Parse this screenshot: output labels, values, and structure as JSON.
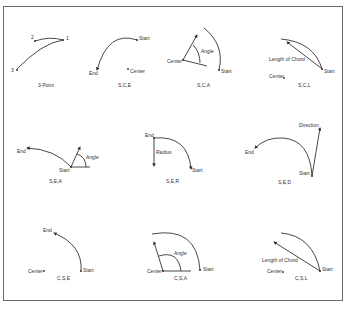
{
  "panels": [
    {
      "id": "3p",
      "caption": "3-Point",
      "labels": {
        "p1": "1",
        "p2": "2",
        "p3": "3"
      }
    },
    {
      "id": "sce",
      "caption": "S,C,E",
      "labels": {
        "start": "Start",
        "center": "Center",
        "end": "End"
      }
    },
    {
      "id": "sca",
      "caption": "S,C,A",
      "labels": {
        "start": "Start",
        "center": "Center",
        "angle": "Angle"
      }
    },
    {
      "id": "scl",
      "caption": "S,C,L",
      "labels": {
        "start": "Start",
        "center": "Center",
        "chord": "Length of Chord"
      }
    },
    {
      "id": "sea",
      "caption": "S,E,A",
      "labels": {
        "start": "Start",
        "end": "End",
        "angle": "Angle"
      }
    },
    {
      "id": "ser",
      "caption": "S,E,R",
      "labels": {
        "start": "Start",
        "end": "End",
        "radius": "Radius"
      }
    },
    {
      "id": "sed",
      "caption": "S,E,D",
      "labels": {
        "start": "Start",
        "end": "End",
        "direction": "Direction"
      }
    },
    {
      "id": "cse",
      "caption": "C,S,E",
      "labels": {
        "start": "Start",
        "center": "Center",
        "end": "End"
      }
    },
    {
      "id": "csa",
      "caption": "C,S,A",
      "labels": {
        "start": "Start",
        "center": "Center",
        "angle": "Angle"
      }
    },
    {
      "id": "csl",
      "caption": "C,S,L",
      "labels": {
        "start": "Start",
        "center": "Center",
        "chord": "Length of Chord"
      }
    }
  ]
}
